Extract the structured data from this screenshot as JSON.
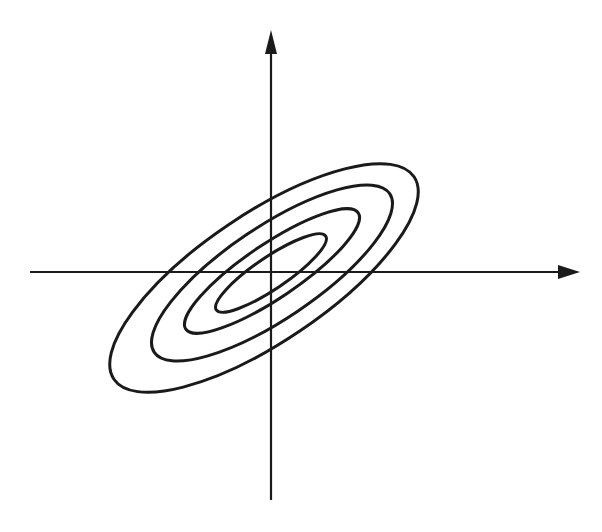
{
  "diagram": {
    "colors": {
      "background": "#ffffff",
      "stroke": "#1a1a1a"
    },
    "axes": {
      "origin": [
        271,
        272
      ],
      "x_axis": {
        "from": [
          30,
          272
        ],
        "to": [
          580,
          272
        ],
        "arrow": "right"
      },
      "y_axis": {
        "from": [
          271,
          500
        ],
        "to": [
          271,
          30
        ],
        "arrow": "up"
      }
    },
    "contours": {
      "rotation_deg": -34,
      "ellipses": [
        {
          "name": "contour-1-inner",
          "cx": 271,
          "cy": 273,
          "rx": 66,
          "ry": 16
        },
        {
          "name": "contour-2",
          "cx": 272,
          "cy": 271,
          "rx": 104,
          "ry": 27
        },
        {
          "name": "contour-3",
          "cx": 272,
          "cy": 273,
          "rx": 142,
          "ry": 46
        },
        {
          "name": "contour-4-outer",
          "cx": 264,
          "cy": 278,
          "rx": 181,
          "ry": 64
        }
      ]
    }
  }
}
